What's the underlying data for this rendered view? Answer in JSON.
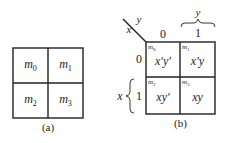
{
  "map_a": {
    "cells": [
      {
        "var": "m",
        "idx": "0"
      },
      {
        "var": "m",
        "idx": "1"
      },
      {
        "var": "m",
        "idx": "2"
      },
      {
        "var": "m",
        "idx": "3"
      }
    ],
    "caption": "(a)"
  },
  "map_b": {
    "corner": {
      "row_var": "x",
      "col_var": "y"
    },
    "col_headers": [
      "0",
      "1"
    ],
    "row_headers": [
      "0",
      "1"
    ],
    "col_brace_label": "y",
    "row_brace_label": "x",
    "cells": [
      {
        "var": "m",
        "idx": "0",
        "expr": "x′y′"
      },
      {
        "var": "m",
        "idx": "1",
        "expr": "x′y"
      },
      {
        "var": "m",
        "idx": "2",
        "expr": "xy′"
      },
      {
        "var": "m",
        "idx": "3",
        "expr": "xy"
      }
    ],
    "caption": "(b)"
  }
}
